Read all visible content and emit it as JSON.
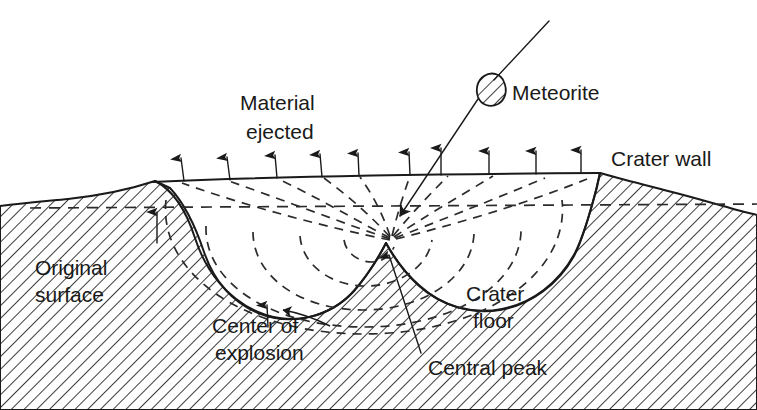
{
  "figure": {
    "type": "cross-section-diagram",
    "background_color": "#ffffff",
    "ink_color": "#1a1a1a"
  },
  "labels": {
    "meteorite": "Meteorite",
    "material_ejected_line1": "Material",
    "material_ejected_line2": "ejected",
    "crater_wall": "Crater wall",
    "original_surface_line1": "Original",
    "original_surface_line2": "surface",
    "crater_floor_line1": "Crater",
    "crater_floor_line2": "floor",
    "center_of_explosion_line1": "Center of",
    "center_of_explosion_line2": "explosion",
    "central_peak": "Central peak"
  },
  "elements": {
    "meteorite_body": "hatched-ovoid-fragment",
    "trajectory": "incoming-impact-path-arrow",
    "ejecta_arrows_count": 10,
    "shock_arcs_count": 5,
    "radial_rays_count": 9,
    "ground_hatching": "diagonal-line-hatch",
    "original_surface_level": "horizontal-dashed-line",
    "central_peak_marker": "small-central-uplift"
  }
}
